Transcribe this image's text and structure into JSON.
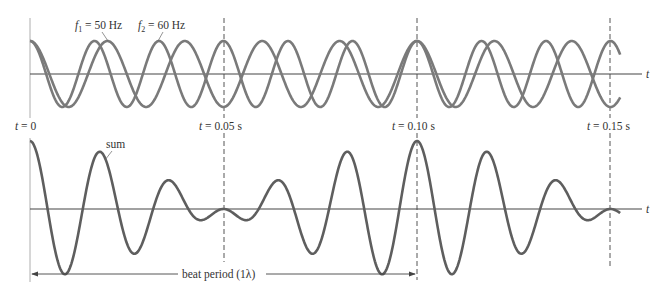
{
  "figure": {
    "top_plot": {
      "wave1_label_var": "f",
      "wave1_label_sub": "1",
      "wave1_label_value": " = 50 Hz",
      "wave2_label_var": "f",
      "wave2_label_sub": "2",
      "wave2_label_value": " = 60 Hz",
      "axis_label": "t"
    },
    "time_markers": [
      {
        "var": "t",
        "value": " = 0"
      },
      {
        "var": "t",
        "value": " = 0.05 s"
      },
      {
        "var": "t",
        "value": " = 0.10 s"
      },
      {
        "var": "t",
        "value": " = 0.15 s"
      }
    ],
    "bottom_plot": {
      "sum_label": "sum",
      "axis_label": "t",
      "beat_period_label": "beat period (1λ)"
    },
    "colors": {
      "wave": "#7a7a7a",
      "sum": "#5e5e5e",
      "axis": "#444444",
      "dashed": "#555555",
      "text": "#333333"
    }
  },
  "chart_data": {
    "type": "line",
    "title": "",
    "xlabel": "t",
    "ylabel": "",
    "time_range_s": [
      0,
      0.1525
    ],
    "marker_times_s": [
      0,
      0.05,
      0.1,
      0.15
    ],
    "series": [
      {
        "name": "f1 = 50 Hz",
        "panel": "top",
        "function": "cos(2*pi*50*t)",
        "frequency_hz": 50,
        "amplitude": 1
      },
      {
        "name": "f2 = 60 Hz",
        "panel": "top",
        "function": "cos(2*pi*60*t)",
        "frequency_hz": 60,
        "amplitude": 1
      },
      {
        "name": "sum",
        "panel": "bottom",
        "function": "cos(2*pi*50*t) + cos(2*pi*60*t)",
        "amplitude": 2
      }
    ],
    "beat_period_s": 0.1,
    "annotations": [
      "beat period (1λ)",
      "t = 0",
      "t = 0.05 s",
      "t = 0.10 s",
      "t = 0.15 s"
    ]
  }
}
